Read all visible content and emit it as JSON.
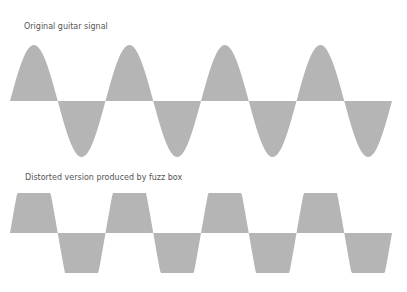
{
  "labels": {
    "original": "Original guitar signal",
    "distorted": "Distorted version produced by fuzz box"
  },
  "colors": {
    "wave_fill": "#b5b5b5",
    "text": "#555555"
  },
  "diagram": {
    "original_wave": {
      "type": "sine",
      "cycles": 4,
      "x_start": 10,
      "x_end": 392,
      "baseline_y": 101,
      "amplitude": 56
    },
    "distorted_wave": {
      "type": "clipped",
      "cycles": 4,
      "x_start": 10,
      "x_end": 392,
      "baseline_y": 233,
      "amplitude": 40
    }
  }
}
